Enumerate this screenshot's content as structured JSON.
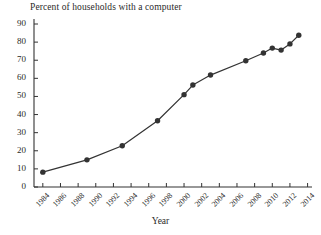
{
  "chart_data": {
    "type": "line",
    "title": "Percent of households with a computer",
    "xlabel": "Year",
    "ylabel": "",
    "xlim": [
      1983,
      2014.5
    ],
    "ylim": [
      0,
      90
    ],
    "grid": false,
    "legend": "none",
    "marker": "filled-circle",
    "line_color": "#333333",
    "marker_color": "#333333",
    "x_tick_labels": [
      "1984",
      "1986",
      "1988",
      "1990",
      "1992",
      "1994",
      "1996",
      "1998",
      "2000",
      "2002",
      "2004",
      "2006",
      "2008",
      "2010",
      "2012",
      "2014"
    ],
    "x_ticks": [
      1984,
      1986,
      1988,
      1990,
      1992,
      1994,
      1996,
      1998,
      2000,
      2002,
      2004,
      2006,
      2008,
      2010,
      2012,
      2014
    ],
    "y_tick_labels": [
      "0",
      "10",
      "20",
      "30",
      "40",
      "50",
      "60",
      "70",
      "80",
      "90"
    ],
    "y_ticks": [
      0,
      10,
      20,
      30,
      40,
      50,
      60,
      70,
      80,
      90
    ],
    "x": [
      1984,
      1989,
      1993,
      1997,
      2000,
      2001,
      2003,
      2007,
      2009,
      2010,
      2011,
      2012,
      2013
    ],
    "values": [
      8.2,
      15.0,
      22.8,
      36.6,
      51.0,
      56.3,
      61.8,
      69.7,
      74.0,
      76.7,
      75.6,
      79.0,
      83.8
    ],
    "series": [
      {
        "name": "Percent of households with a computer",
        "points": [
          {
            "x": 1984,
            "y": 8.2
          },
          {
            "x": 1989,
            "y": 15.0
          },
          {
            "x": 1993,
            "y": 22.8
          },
          {
            "x": 1997,
            "y": 36.6
          },
          {
            "x": 2000,
            "y": 51.0
          },
          {
            "x": 2001,
            "y": 56.3
          },
          {
            "x": 2003,
            "y": 61.8
          },
          {
            "x": 2007,
            "y": 69.7
          },
          {
            "x": 2009,
            "y": 74.0
          },
          {
            "x": 2010,
            "y": 76.7
          },
          {
            "x": 2011,
            "y": 75.6
          },
          {
            "x": 2012,
            "y": 79.0
          },
          {
            "x": 2013,
            "y": 83.8
          }
        ]
      }
    ]
  }
}
